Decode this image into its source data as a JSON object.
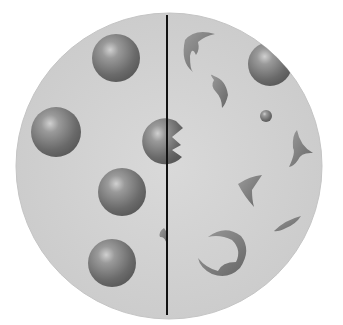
{
  "figure": {
    "background": "#ffffff",
    "field": {
      "cx": 169,
      "cy": 166,
      "r": 153,
      "fill": "#d2d2d2",
      "stroke": "#bdbdbd"
    },
    "divider": {
      "x": 167,
      "y1": 15,
      "y2": 315,
      "color": "#111111"
    },
    "left_panel": {
      "label": "intact spherical cells",
      "spheres": [
        {
          "cx": 116,
          "cy": 58,
          "r": 24
        },
        {
          "cx": 56,
          "cy": 132,
          "r": 25
        },
        {
          "cx": 122,
          "cy": 192,
          "r": 24
        },
        {
          "cx": 112,
          "cy": 263,
          "r": 24
        }
      ]
    },
    "center_cell": {
      "label": "partially bitten cell",
      "cx": 163,
      "cy": 140,
      "r": 23
    },
    "right_panel": {
      "label": "fragmented cells",
      "large_sphere": {
        "cx": 270,
        "cy": 64,
        "r": 22
      },
      "small_sphere": {
        "cx": 266,
        "cy": 116,
        "r": 6
      }
    },
    "colors": {
      "sphere_dark": "#5a5a5a",
      "sphere_mid": "#8a8a8a",
      "sphere_light": "#d8d8d8",
      "fragment": "#7a7a7a"
    }
  }
}
